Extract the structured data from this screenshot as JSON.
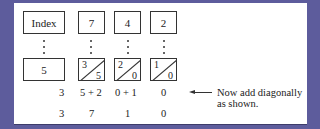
{
  "diagram": {
    "top_row": [
      "Index",
      "7",
      "4",
      "2"
    ],
    "multiplier": "5",
    "lattice_cells": [
      {
        "tens": "3",
        "units": "5"
      },
      {
        "tens": "2",
        "units": "0"
      },
      {
        "tens": "1",
        "units": "0"
      }
    ],
    "diagonal_sums": [
      "3",
      "5 + 2",
      "0 + 1",
      "0"
    ],
    "result_digits": [
      "3",
      "7",
      "1",
      "0"
    ],
    "annotation": {
      "line1": "Now add diagonally",
      "line2": "as shown."
    }
  },
  "colors": {
    "background": "#5d5c9c",
    "panel": "#ffffff",
    "ink": "#222222"
  }
}
